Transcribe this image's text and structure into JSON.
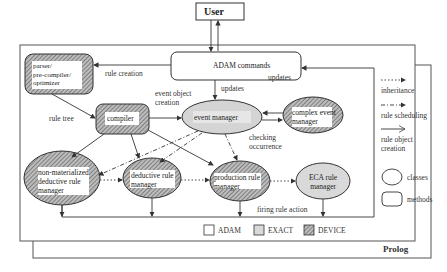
{
  "diagram": {
    "user": "User",
    "adam_commands": "ADAM commands",
    "prolog": "Prolog",
    "nodes": {
      "parser": [
        "parser/",
        "pre-compiler/",
        "optimizer"
      ],
      "compiler": "compiler",
      "event_manager": "event manager",
      "complex_event_manager": [
        "complex event",
        "manager"
      ],
      "non_materialized": [
        "non-materialized",
        "deductive rule",
        "manager"
      ],
      "deductive": [
        "deductive rule",
        "manager"
      ],
      "production": [
        "production rule",
        "manager"
      ],
      "eca": [
        "ECA rule",
        "manager"
      ]
    },
    "edge_labels": {
      "rule_creation": "rule creation",
      "updates_top": "updates",
      "updates_mid": "updates",
      "event_object_creation": [
        "event object",
        "creation"
      ],
      "rule_tree": "rule tree",
      "checking_occurrence": [
        "checking",
        "occurrence"
      ],
      "firing_rule_action": "firing rule action"
    },
    "legend_arrows": [
      {
        "style": "dotted",
        "label": [
          "inheritance"
        ]
      },
      {
        "style": "dash-dot",
        "label": [
          "rule scheduling"
        ]
      },
      {
        "style": "solid",
        "label": [
          "rule object",
          "creation"
        ]
      }
    ],
    "legend_shapes": [
      {
        "shape": "ellipse",
        "label": "classes"
      },
      {
        "shape": "rounded-rect",
        "label": "methods"
      }
    ],
    "legend_fills": [
      {
        "fill": "white",
        "label": "ADAM"
      },
      {
        "fill": "light-gray",
        "label": "EXACT"
      },
      {
        "fill": "hatched",
        "label": "DEVICE"
      }
    ],
    "colors": {
      "line": "#333333",
      "exact_fill": "#d9d9d9",
      "hatch": "#555555"
    }
  }
}
